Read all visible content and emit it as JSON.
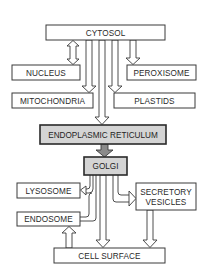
{
  "diagram": {
    "type": "flowchart",
    "nodes": {
      "cytosol": {
        "label": "CYTOSOL",
        "style": "plain"
      },
      "nucleus": {
        "label": "NUCLEUS",
        "style": "plain"
      },
      "peroxisome": {
        "label": "PEROXISOME",
        "style": "plain"
      },
      "mitochondria": {
        "label": "MITOCHONDRIA",
        "style": "plain"
      },
      "plastids": {
        "label": "PLASTIDS",
        "style": "plain"
      },
      "er": {
        "label": "ENDOPLASMIC RETICULUM",
        "style": "highlighted"
      },
      "golgi": {
        "label": "GOLGI",
        "style": "highlighted"
      },
      "lysosome": {
        "label": "LYSOSOME",
        "style": "plain"
      },
      "secretory_line1": {
        "label": "SECRETORY",
        "style": "plain"
      },
      "secretory_line2": {
        "label": "VESICLES",
        "style": "plain"
      },
      "endosome": {
        "label": "ENDOSOME",
        "style": "plain"
      },
      "cell_surface": {
        "label": "CELL SURFACE",
        "style": "plain"
      }
    },
    "edges": [
      {
        "from": "CYTOSOL",
        "to": "NUCLEUS",
        "type": "bidirectional"
      },
      {
        "from": "CYTOSOL",
        "to": "PEROXISOME",
        "type": "one-way"
      },
      {
        "from": "CYTOSOL",
        "to": "MITOCHONDRIA",
        "type": "one-way"
      },
      {
        "from": "CYTOSOL",
        "to": "PLASTIDS",
        "type": "one-way"
      },
      {
        "from": "CYTOSOL",
        "to": "ENDOPLASMIC RETICULUM",
        "type": "one-way"
      },
      {
        "from": "ENDOPLASMIC RETICULUM",
        "to": "GOLGI",
        "type": "one-way-highlighted"
      },
      {
        "from": "GOLGI",
        "to": "LYSOSOME",
        "type": "one-way"
      },
      {
        "from": "GOLGI",
        "to": "SECRETORY VESICLES",
        "type": "one-way"
      },
      {
        "from": "GOLGI",
        "to": "CELL SURFACE",
        "type": "one-way"
      },
      {
        "from": "ENDOSOME",
        "to": "LYSOSOME",
        "type": "one-way"
      },
      {
        "from": "SECRETORY VESICLES",
        "to": "CELL SURFACE",
        "type": "one-way"
      },
      {
        "from": "CELL SURFACE",
        "to": "ENDOSOME",
        "type": "one-way"
      }
    ],
    "colors": {
      "box_fill": "#ffffff",
      "highlight_fill": "#d4d4d4",
      "stroke": "#3a3a3a",
      "highlight_arrow": "#8a8a8a"
    }
  }
}
